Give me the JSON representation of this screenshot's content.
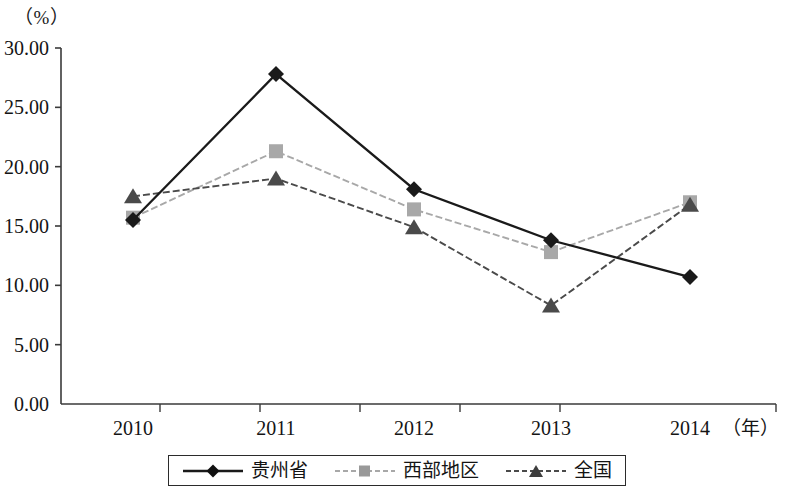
{
  "chart_data": {
    "type": "line",
    "title": "",
    "xlabel": "年",
    "ylabel": "%",
    "x_unit_label": "（年）",
    "y_unit_label": "（%）",
    "categories": [
      "2010",
      "2011",
      "2012",
      "2013",
      "2014"
    ],
    "ylim": [
      0,
      30
    ],
    "ytick_step": 5,
    "ytick_labels": [
      "0.00",
      "5.00",
      "10.00",
      "15.00",
      "20.00",
      "25.00",
      "30.00"
    ],
    "ytick_values": [
      0,
      5,
      10,
      15,
      20,
      25,
      30
    ],
    "grid": false,
    "legend_position": "bottom",
    "series": [
      {
        "name": "贵州省",
        "marker": "diamond",
        "color": "#1a1a1a",
        "line_style": "solid",
        "values": [
          15.5,
          27.8,
          18.1,
          13.8,
          10.7
        ]
      },
      {
        "name": "西部地区",
        "marker": "square",
        "color": "#a8a8a8",
        "line_style": "dashed",
        "values": [
          15.7,
          21.3,
          16.4,
          12.8,
          17.0
        ]
      },
      {
        "name": "全国",
        "marker": "triangle",
        "color": "#4a4a4a",
        "line_style": "dashed",
        "values": [
          17.5,
          19.0,
          14.9,
          8.3,
          16.8
        ]
      }
    ]
  },
  "legend": {
    "items": [
      {
        "label": "贵州省"
      },
      {
        "label": "西部地区"
      },
      {
        "label": "全国"
      }
    ]
  },
  "axes": {
    "y_unit": "（%）",
    "x_unit": "（年）"
  }
}
